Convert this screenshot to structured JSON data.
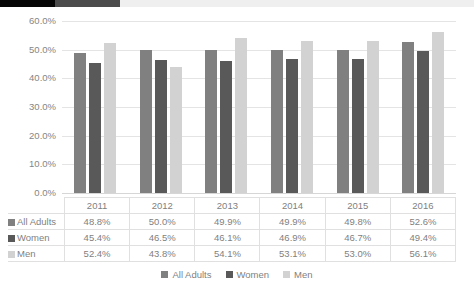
{
  "top_strip": {
    "segments": [
      "black",
      "dark-gray",
      "pale-gray"
    ]
  },
  "chart_data": {
    "type": "bar",
    "title": "",
    "subtitle": "",
    "xlabel": "",
    "ylabel": "",
    "ylim": [
      0,
      60
    ],
    "grid": true,
    "legend_position": "bottom",
    "categories": [
      "2011",
      "2012",
      "2013",
      "2014",
      "2015",
      "2016"
    ],
    "ytick_labels": [
      "60.0%",
      "50.0%",
      "40.0%",
      "30.0%",
      "20.0%",
      "10.0%",
      "0.0%"
    ],
    "ytick_values": [
      60,
      50,
      40,
      30,
      20,
      10,
      0
    ],
    "value_suffix": "%",
    "series": [
      {
        "name": "All Adults",
        "color": "#808080",
        "values": [
          48.8,
          50.0,
          49.9,
          49.9,
          49.8,
          52.6
        ],
        "labels": [
          "48.8%",
          "50.0%",
          "49.9%",
          "49.9%",
          "49.8%",
          "52.6%"
        ]
      },
      {
        "name": "Women",
        "color": "#595959",
        "values": [
          45.4,
          46.5,
          46.1,
          46.9,
          46.7,
          49.4
        ],
        "labels": [
          "45.4%",
          "46.5%",
          "46.1%",
          "46.9%",
          "46.7%",
          "49.4%"
        ]
      },
      {
        "name": "Men",
        "color": "#d2d2d2",
        "values": [
          52.4,
          43.8,
          54.1,
          53.1,
          53.0,
          56.1
        ],
        "labels": [
          "52.4%",
          "43.8%",
          "54.1%",
          "53.1%",
          "53.0%",
          "56.1%"
        ]
      }
    ]
  },
  "legend": {
    "items": [
      {
        "label": "All Adults",
        "swatch": "legend-swatch-all-adults"
      },
      {
        "label": "Women",
        "swatch": "legend-swatch-women"
      },
      {
        "label": "Men",
        "swatch": "legend-swatch-men"
      }
    ]
  }
}
